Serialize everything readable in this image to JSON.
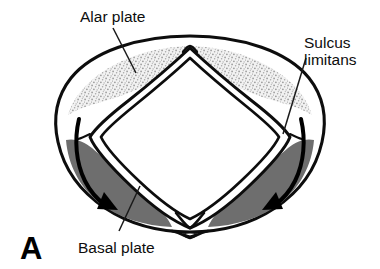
{
  "figure": {
    "panel_letter": "A",
    "kind": "neural-tube-cross-section-diagram",
    "background_color": "#ffffff"
  },
  "labels": {
    "alar_plate": "Alar plate",
    "sulcus_limitans_line1": "Sulcus",
    "sulcus_limitans_line2": "limitans",
    "basal_plate": "Basal plate"
  },
  "colors": {
    "outline": "#0d0d0d",
    "alar_plate_stipple": "#b9b9b9",
    "alar_plate_fill": "#e8e8e8",
    "basal_plate_fill": "#6e6e6e",
    "canal_lumen": "#ffffff",
    "leader_line": "#1a1a1a",
    "arrow": "#000000"
  },
  "structures": [
    {
      "name": "outer-neural-tube-wall",
      "shading": "outline-only"
    },
    {
      "name": "central-canal",
      "shape": "diamond",
      "shading": "white-lumen"
    },
    {
      "name": "alar-plate-left",
      "shading": "stippled-light-gray"
    },
    {
      "name": "alar-plate-right",
      "shading": "stippled-light-gray"
    },
    {
      "name": "basal-plate-left",
      "shading": "solid-dark-gray"
    },
    {
      "name": "basal-plate-right",
      "shading": "solid-dark-gray"
    },
    {
      "name": "sulcus-limitans-left",
      "shading": "boundary-groove"
    },
    {
      "name": "sulcus-limitans-right",
      "shading": "boundary-groove"
    }
  ],
  "arrows": [
    {
      "name": "migration-arrow-left",
      "direction": "clockwise-down-right"
    },
    {
      "name": "migration-arrow-right",
      "direction": "counterclockwise-down-left"
    }
  ]
}
